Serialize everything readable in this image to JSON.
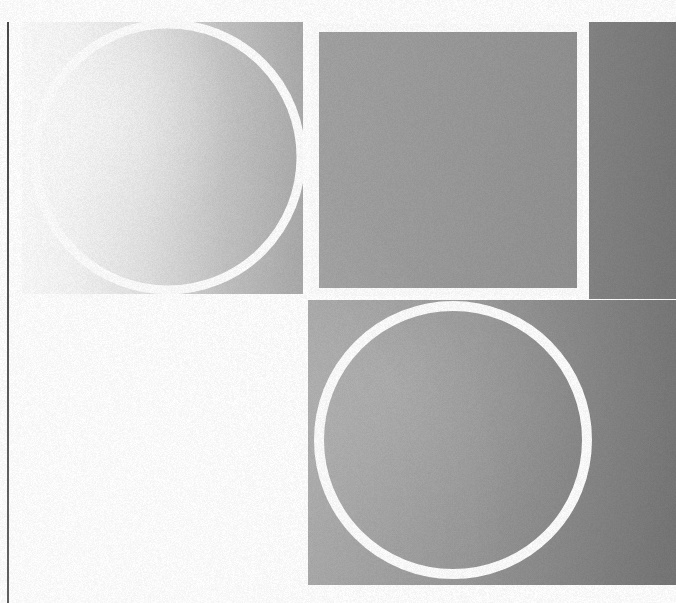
{
  "artwork": {
    "title": "Abstract Geometric Composition",
    "medium": "flat vector shapes on gradient field",
    "canvas": {
      "width": 676,
      "height": 603,
      "background_color": "#ffffff"
    },
    "texture": {
      "type": "film-grain",
      "intensity": "subtle",
      "opacity": 0.5
    },
    "palette": {
      "page_background": "#ffffff",
      "stroke_white": "#fdfdfd",
      "rule_dark": "#4a4a4a",
      "gradient_light": "#fafafa",
      "gradient_mid": "#b4b4b4",
      "gradient_dark": "#8a8a8a",
      "gradient_deep": "#777777",
      "panel_gray": "#9a9a9a"
    },
    "elements": [
      {
        "id": "vertical-rule",
        "name": "vertical-rule",
        "shape": "line",
        "orientation": "vertical",
        "x": 7,
        "y_start": 22,
        "y_end": 603,
        "thickness": 2,
        "color": "#4a4a4a"
      },
      {
        "id": "upper-left-panel",
        "name": "upper-left-gradient-panel",
        "shape": "rectangle",
        "x": 22,
        "y": 22,
        "width": 286,
        "height": 276,
        "fill": "horizontal gradient #f7f7f7 to #a8a8a8"
      },
      {
        "id": "upper-left-circle",
        "name": "outlined-circle-top-left",
        "shape": "circle",
        "center_x": 168,
        "center_y": 156,
        "radius": 134,
        "stroke": "#fdfdfd",
        "stroke_width": 9,
        "fill": "none"
      },
      {
        "id": "upper-square",
        "name": "outlined-square-top-center",
        "shape": "square",
        "x": 311,
        "y": 24,
        "width": 274,
        "height": 272,
        "stroke": "#fdfdfd",
        "stroke_width": 8,
        "fill": "gray gradient"
      },
      {
        "id": "upper-right-strip",
        "name": "upper-right-dark-strip",
        "shape": "rectangle",
        "x": 589,
        "y": 22,
        "width": 87,
        "height": 276,
        "fill": "#7c7c7c"
      },
      {
        "id": "lower-left-field",
        "name": "lower-left-white-field",
        "shape": "rectangle",
        "x": 7,
        "y": 298,
        "width": 301,
        "height": 305,
        "fill": "#ffffff"
      },
      {
        "id": "lower-right-panel",
        "name": "lower-right-gradient-panel",
        "shape": "rectangle",
        "x": 308,
        "y": 300,
        "width": 368,
        "height": 285,
        "fill": "horizontal gradient #9e9e9e to #787878"
      },
      {
        "id": "lower-right-circle",
        "name": "outlined-circle-bottom-right",
        "shape": "circle",
        "center_x": 453,
        "center_y": 440,
        "radius": 135,
        "stroke": "#fdfdfd",
        "stroke_width": 10,
        "fill": "none"
      }
    ],
    "composition_notes": {
      "grid": "two-row, asymmetric column split at x=308",
      "gradient_direction": "left-to-right, light to dark",
      "repeated_motif": "white hairline circle outline",
      "negative_space": "lower-left quadrant left empty white"
    }
  }
}
